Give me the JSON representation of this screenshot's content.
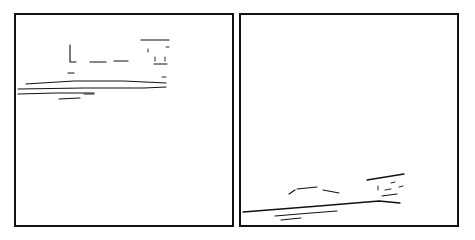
{
  "document": {
    "title": "Two-panel line sketch",
    "background_color": "#ffffff",
    "ink_color": "#111111",
    "width": 475,
    "height": 240
  },
  "panels": [
    {
      "id": "left-panel",
      "label": "Left sketch panel",
      "frame": {
        "x": 14,
        "y": 13,
        "width": 220,
        "height": 214
      },
      "border_color": "#111111",
      "border_width": 2,
      "fill_color": "#ffffff",
      "strokes": [
        {
          "name": "ground-line-upper",
          "type": "polyline",
          "points": "12,71 60,68 110,68 152,70",
          "width": 1.0
        },
        {
          "name": "ground-line-main",
          "type": "polyline",
          "points": "4,76 70,75 130,75 152,74",
          "width": 1.2
        },
        {
          "name": "ground-line-lower",
          "type": "polyline",
          "points": "4,81 42,80 80,80",
          "width": 1.1
        },
        {
          "name": "ground-tick-short",
          "type": "polyline",
          "points": "45,86 66,85",
          "width": 1.0
        },
        {
          "name": "ground-tick-tiny",
          "type": "polyline",
          "points": "70,81 80,81",
          "width": 0.9
        },
        {
          "name": "vertical-post",
          "type": "polyline",
          "points": "56,32 56,49 62,49",
          "width": 1.1
        },
        {
          "name": "post-base-mark",
          "type": "polyline",
          "points": "54,60 60,60",
          "width": 1.1
        },
        {
          "name": "dash-segment-a",
          "type": "polyline",
          "points": "76,49 92,49",
          "width": 1.1
        },
        {
          "name": "dash-segment-b",
          "type": "polyline",
          "points": "100,48 114,48",
          "width": 1.1
        },
        {
          "name": "upper-bar",
          "type": "polyline",
          "points": "127,27 155,27",
          "width": 1.2
        },
        {
          "name": "detail-mark-1",
          "type": "polyline",
          "points": "134,36 134,39",
          "width": 0.9
        },
        {
          "name": "detail-mark-2",
          "type": "polyline",
          "points": "152,34 155,34",
          "width": 0.9
        },
        {
          "name": "detail-mark-3",
          "type": "polyline",
          "points": "141,44 141,48",
          "width": 0.9
        },
        {
          "name": "detail-mark-4",
          "type": "polyline",
          "points": "151,44 151,48",
          "width": 0.9
        },
        {
          "name": "detail-bar-small",
          "type": "polyline",
          "points": "140,51 153,51",
          "width": 1.0
        },
        {
          "name": "speck-mark",
          "type": "polyline",
          "points": "148,64 152,64",
          "width": 0.9
        }
      ]
    },
    {
      "id": "right-panel",
      "label": "Right sketch panel",
      "frame": {
        "x": 239,
        "y": 13,
        "width": 220,
        "height": 214
      },
      "border_color": "#111111",
      "border_width": 2,
      "fill_color": "#ffffff",
      "strokes": [
        {
          "name": "ground-line-main",
          "type": "polyline",
          "points": "4,199 80,193 140,188 161,190",
          "width": 1.3
        },
        {
          "name": "ground-line-echo",
          "type": "polyline",
          "points": "36,203 72,200 98,198",
          "width": 1.0
        },
        {
          "name": "ground-tick-short",
          "type": "polyline",
          "points": "42,207 62,205",
          "width": 1.0
        },
        {
          "name": "dash-segment-a",
          "type": "polyline",
          "points": "58,176 78,174",
          "width": 1.1
        },
        {
          "name": "dash-segment-b",
          "type": "polyline",
          "points": "84,177 100,180",
          "width": 1.1
        },
        {
          "name": "corner-mark",
          "type": "polyline",
          "points": "50,181 56,177",
          "width": 1.2
        },
        {
          "name": "upper-bar",
          "type": "polyline",
          "points": "128,167 165,161",
          "width": 1.3
        },
        {
          "name": "detail-mark-1",
          "type": "polyline",
          "points": "139,173 139,177",
          "width": 0.9
        },
        {
          "name": "detail-mark-2",
          "type": "polyline",
          "points": "152,170 156,169",
          "width": 0.9
        },
        {
          "name": "detail-mark-3",
          "type": "polyline",
          "points": "146,177 152,176",
          "width": 0.9
        },
        {
          "name": "detail-bar-small",
          "type": "polyline",
          "points": "143,183 158,181",
          "width": 1.0
        },
        {
          "name": "detail-mark-4",
          "type": "polyline",
          "points": "160,174 164,173",
          "width": 0.9
        }
      ]
    }
  ]
}
